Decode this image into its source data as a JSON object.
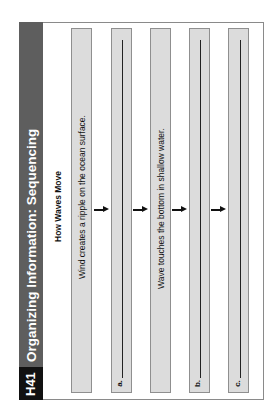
{
  "page": {
    "code": "H41",
    "title": "Organizing Information: Sequencing",
    "heading": "How Waves Move"
  },
  "sequence": [
    {
      "type": "given",
      "text": "Wind creates a ripple on the ocean surface."
    },
    {
      "type": "blank",
      "label": "a."
    },
    {
      "type": "given",
      "text": "Wave touches the bottom in shallow water."
    },
    {
      "type": "blank",
      "label": "b."
    },
    {
      "type": "blank",
      "label": "c."
    }
  ],
  "colors": {
    "sidebar": "#5e5e5e",
    "code_block": "#111111",
    "box_fill": "#dcdcdc",
    "box_border": "#8f8f8f"
  }
}
